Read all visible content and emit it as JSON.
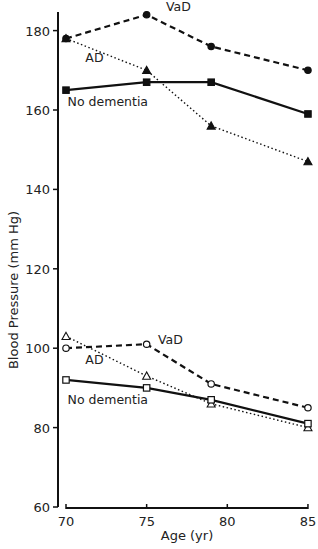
{
  "chart_data": {
    "type": "line",
    "title": "",
    "xlabel": "Age (yr)",
    "ylabel": "Blood Pressure (mm Hg)",
    "xlim": [
      70,
      85
    ],
    "ylim": [
      60,
      185
    ],
    "x_ticks": [
      70,
      75,
      80,
      85
    ],
    "y_ticks": [
      60,
      80,
      100,
      120,
      140,
      160,
      180
    ],
    "grid": false,
    "legend": "inline labels",
    "x": [
      70,
      75,
      79,
      85
    ],
    "series": [
      {
        "name": "VaD",
        "group": "systolic",
        "style": "dashed",
        "marker": "filled-circle",
        "values": [
          178,
          184,
          176,
          170
        ]
      },
      {
        "name": "AD",
        "group": "systolic",
        "style": "dotted",
        "marker": "filled-triangle",
        "values": [
          178,
          170,
          156,
          147
        ]
      },
      {
        "name": "No dementia",
        "group": "systolic",
        "style": "solid",
        "marker": "filled-square",
        "values": [
          165,
          167,
          167,
          159
        ]
      },
      {
        "name": "VaD",
        "group": "diastolic",
        "style": "dashed",
        "marker": "open-circle",
        "values": [
          100,
          101,
          91,
          85
        ]
      },
      {
        "name": "AD",
        "group": "diastolic",
        "style": "dotted",
        "marker": "open-triangle",
        "values": [
          103,
          93,
          86,
          80
        ]
      },
      {
        "name": "No dementia",
        "group": "diastolic",
        "style": "solid",
        "marker": "open-square",
        "values": [
          92,
          90,
          87,
          81
        ]
      }
    ],
    "annotations": [
      {
        "text": "VaD",
        "x": 76.2,
        "y": 185
      },
      {
        "text": "AD",
        "x": 71.2,
        "y": 172
      },
      {
        "text": "No dementia",
        "x": 70.1,
        "y": 161
      },
      {
        "text": "VaD",
        "x": 75.7,
        "y": 101
      },
      {
        "text": "AD",
        "x": 71.2,
        "y": 96
      },
      {
        "text": "No dementia",
        "x": 70.1,
        "y": 86
      }
    ]
  }
}
